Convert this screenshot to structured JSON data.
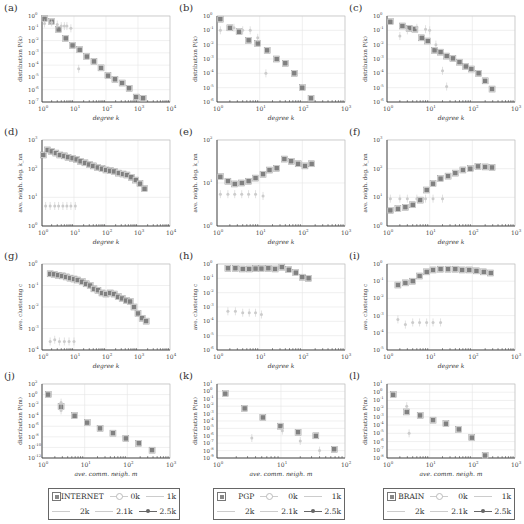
{
  "figure": {
    "panels": [
      {
        "id": "a",
        "label": "(a)"
      },
      {
        "id": "b",
        "label": "(b)"
      },
      {
        "id": "c",
        "label": "(c)"
      },
      {
        "id": "d",
        "label": "(d)"
      },
      {
        "id": "e",
        "label": "(e)"
      },
      {
        "id": "f",
        "label": "(f)"
      },
      {
        "id": "g",
        "label": "(g)"
      },
      {
        "id": "h",
        "label": "(h)"
      },
      {
        "id": "i",
        "label": "(i)"
      },
      {
        "id": "j",
        "label": "(j)"
      },
      {
        "id": "k",
        "label": "(k)"
      },
      {
        "id": "l",
        "label": "(l)"
      }
    ],
    "legends": [
      {
        "dataset": "INTERNET",
        "items": [
          "0k",
          "1k",
          "2k",
          "2.1k",
          "2.5k"
        ]
      },
      {
        "dataset": "PGP",
        "items": [
          "0k",
          "1k",
          "2k",
          "2.1k",
          "2.5k"
        ]
      },
      {
        "dataset": "BRAIN",
        "items": [
          "0k",
          "1k",
          "2k",
          "2.1k",
          "2.5k"
        ]
      }
    ],
    "colors": {
      "dataset_marker": "#808080",
      "model_light": "#cccccc",
      "grid": "#e6e6e6",
      "axis": "#333333"
    }
  },
  "chart_data": [
    {
      "id": "a",
      "type": "scatter",
      "title": "",
      "xlabel": "degree k",
      "ylabel": "distribution P(k)",
      "xscale": "log",
      "yscale": "log",
      "xlim": [
        1,
        10000
      ],
      "ylim": [
        1e-07,
        1
      ],
      "xticks": [
        "10^0",
        "10^1",
        "10^2",
        "10^3",
        "10^4"
      ],
      "yticks": [
        "10^0",
        "10^-1",
        "10^-2",
        "10^-3",
        "10^-4",
        "10^-5",
        "10^-6",
        "10^-7"
      ],
      "grid": true,
      "series": [
        {
          "name": "INTERNET",
          "x": [
            1.2,
            2,
            3.3,
            5.5,
            9,
            15,
            25,
            42,
            70,
            115,
            190,
            320,
            530,
            880,
            1450
          ],
          "y": [
            0.6,
            0.35,
            0.08,
            0.015,
            0.004,
            0.0018,
            0.0005,
            0.0002,
            6e-05,
            1.4e-05,
            7e-06,
            3.5e-06,
            1.3e-06,
            2.5e-07,
            2e-07
          ]
        },
        {
          "name": "model",
          "x": [
            1.2,
            2,
            3,
            4,
            5,
            6,
            8,
            14
          ],
          "y": [
            0.25,
            0.3,
            0.2,
            0.15,
            0.15,
            0.15,
            0.1,
            5e-05
          ]
        }
      ]
    },
    {
      "id": "b",
      "type": "scatter",
      "title": "",
      "xlabel": "degree k",
      "ylabel": "distribution P(k)",
      "xscale": "log",
      "yscale": "log",
      "xlim": [
        1,
        1000
      ],
      "ylim": [
        1e-06,
        1
      ],
      "xticks": [
        "10^0",
        "10^1",
        "10^2",
        "10^3"
      ],
      "yticks": [
        "10^0",
        "10^-1",
        "10^-2",
        "10^-3",
        "10^-4",
        "10^-5",
        "10^-6"
      ],
      "grid": true,
      "series": [
        {
          "name": "PGP",
          "x": [
            1.2,
            2,
            3.3,
            5.5,
            9,
            15,
            25,
            40,
            65,
            100,
            160
          ],
          "y": [
            0.6,
            0.15,
            0.08,
            0.02,
            0.012,
            0.004,
            0.001,
            0.0005,
            0.0001,
            1e-05,
            1.8e-06
          ]
        },
        {
          "name": "model",
          "x": [
            1.2,
            2.5,
            4,
            6,
            9,
            14
          ],
          "y": [
            0.1,
            0.15,
            0.1,
            0.1,
            0.03,
            0.0001
          ]
        }
      ]
    },
    {
      "id": "c",
      "type": "scatter",
      "title": "",
      "xlabel": "degree k",
      "ylabel": "distribution P(k)",
      "xscale": "log",
      "yscale": "log",
      "xlim": [
        1,
        1000
      ],
      "ylim": [
        1e-06,
        1
      ],
      "xticks": [
        "10^0",
        "10^1",
        "10^2",
        "10^3"
      ],
      "yticks": [
        "10^0",
        "10^-1",
        "10^-2",
        "10^-3",
        "10^-4",
        "10^-5",
        "10^-6"
      ],
      "grid": true,
      "series": [
        {
          "name": "BRAIN",
          "x": [
            1.2,
            2.3,
            3.3,
            4.5,
            6.5,
            9,
            13,
            18,
            25,
            35,
            50,
            70,
            95,
            140,
            200,
            290
          ],
          "y": [
            0.4,
            0.2,
            0.14,
            0.12,
            0.03,
            0.018,
            0.004,
            0.003,
            0.0016,
            0.0011,
            0.0006,
            0.0003,
            0.0002,
            0.0001,
            3e-05,
            8e-06
          ]
        },
        {
          "name": "model",
          "x": [
            2,
            3,
            5,
            8,
            10,
            14,
            20,
            25
          ],
          "y": [
            0.04,
            0.1,
            0.15,
            0.12,
            0.1,
            0.01,
            0.00015,
            1.2e-05
          ]
        }
      ]
    },
    {
      "id": "d",
      "type": "scatter",
      "title": "",
      "xlabel": "degree k",
      "ylabel": "ave. neigh. deg. k_nn",
      "xscale": "log",
      "yscale": "log",
      "xlim": [
        1,
        10000
      ],
      "ylim": [
        1,
        1000
      ],
      "xticks": [
        "10^0",
        "10^1",
        "10^2",
        "10^3",
        "10^4"
      ],
      "yticks": [
        "10^3",
        "10^2",
        "10^1",
        "10^0"
      ],
      "grid": true,
      "series": [
        {
          "name": "INTERNET",
          "x": [
            1.1,
            1.5,
            2,
            2.7,
            3.6,
            5,
            6.5,
            9,
            12,
            16,
            22,
            30,
            40,
            55,
            75,
            100,
            135,
            180,
            250,
            340,
            450,
            620,
            850,
            1150,
            1600
          ],
          "y": [
            300,
            450,
            400,
            350,
            300,
            280,
            250,
            230,
            210,
            180,
            160,
            140,
            125,
            110,
            100,
            90,
            85,
            80,
            70,
            65,
            60,
            50,
            40,
            30,
            20
          ]
        },
        {
          "name": "model",
          "x": [
            1.3,
            1.8,
            2.5,
            3.3,
            4.5,
            6,
            8,
            11
          ],
          "y": [
            5,
            5,
            5,
            5,
            5,
            5,
            5,
            5
          ]
        }
      ]
    },
    {
      "id": "e",
      "type": "scatter",
      "title": "",
      "xlabel": "degree k",
      "ylabel": "ave. neigh. deg. k_nn",
      "xscale": "log",
      "yscale": "log",
      "xlim": [
        1,
        1000
      ],
      "ylim": [
        1,
        100
      ],
      "xticks": [
        "10^0",
        "10^1",
        "10^2",
        "10^3"
      ],
      "yticks": [
        "10^2",
        "10^1",
        "10^0"
      ],
      "grid": true,
      "series": [
        {
          "name": "PGP",
          "x": [
            1.2,
            1.8,
            2.6,
            3.8,
            5.5,
            8,
            12,
            17,
            25,
            38,
            55,
            80,
            115,
            165
          ],
          "y": [
            14,
            11,
            9.5,
            10,
            11,
            13,
            16,
            20,
            22,
            36,
            32,
            28,
            25,
            28
          ]
        },
        {
          "name": "model",
          "x": [
            1.2,
            1.8,
            2.6,
            3.8,
            5.5,
            8,
            12
          ],
          "y": [
            5.5,
            5.5,
            5.5,
            5.5,
            5.5,
            5.5,
            5
          ]
        }
      ]
    },
    {
      "id": "f",
      "type": "scatter",
      "title": "",
      "xlabel": "degree k",
      "ylabel": "ave. neigh. deg. k_nn",
      "xscale": "log",
      "yscale": "log",
      "xlim": [
        1,
        1000
      ],
      "ylim": [
        1,
        1000
      ],
      "xticks": [
        "10^0",
        "10^1",
        "10^2",
        "10^3"
      ],
      "yticks": [
        "10^3",
        "10^2",
        "10^1",
        "10^0"
      ],
      "grid": true,
      "series": [
        {
          "name": "BRAIN",
          "x": [
            1.2,
            1.8,
            2.7,
            4,
            6,
            8.5,
            12,
            18,
            27,
            40,
            60,
            90,
            135,
            200,
            290
          ],
          "y": [
            3.5,
            4,
            4.5,
            5.5,
            8,
            18,
            30,
            45,
            55,
            70,
            90,
            100,
            120,
            115,
            110
          ]
        },
        {
          "name": "model",
          "x": [
            1.2,
            2,
            3,
            5,
            8,
            12,
            20
          ],
          "y": [
            9,
            9,
            9,
            9,
            9,
            9,
            9
          ]
        }
      ]
    },
    {
      "id": "g",
      "type": "scatter",
      "title": "",
      "xlabel": "degree k",
      "ylabel": "ave. clustering c",
      "xscale": "log",
      "yscale": "log",
      "xlim": [
        1,
        10000
      ],
      "ylim": [
        0.0001,
        1
      ],
      "xticks": [
        "10^0",
        "10^1",
        "10^2",
        "10^3",
        "10^4"
      ],
      "yticks": [
        "10^0",
        "10^-1",
        "10^-2",
        "10^-3",
        "10^-4"
      ],
      "grid": true,
      "series": [
        {
          "name": "INTERNET",
          "x": [
            1.8,
            2.4,
            3.2,
            4.3,
            5.7,
            7.5,
            10,
            13,
            18,
            24,
            32,
            42,
            56,
            75,
            100,
            135,
            180,
            240,
            320,
            430,
            570,
            750,
            1000,
            1350,
            1800
          ],
          "y": [
            0.35,
            0.33,
            0.3,
            0.28,
            0.25,
            0.22,
            0.2,
            0.18,
            0.15,
            0.12,
            0.1,
            0.07,
            0.06,
            0.045,
            0.04,
            0.045,
            0.04,
            0.03,
            0.025,
            0.02,
            0.018,
            0.01,
            0.005,
            0.003,
            0.0022
          ]
        },
        {
          "name": "model",
          "x": [
            1.8,
            2.5,
            3.5,
            5,
            7,
            10
          ],
          "y": [
            0.00025,
            0.0003,
            0.00025,
            0.00025,
            0.00025,
            0.00025
          ]
        }
      ]
    },
    {
      "id": "h",
      "type": "scatter",
      "title": "",
      "xlabel": "degree k",
      "ylabel": "ave. clustering c",
      "xscale": "log",
      "yscale": "log",
      "xlim": [
        1,
        1000
      ],
      "ylim": [
        1e-06,
        1
      ],
      "xticks": [
        "10^0",
        "10^1",
        "10^2",
        "10^3"
      ],
      "yticks": [
        "10^0",
        "10^-1",
        "10^-2",
        "10^-3",
        "10^-4",
        "10^-5",
        "10^-6"
      ],
      "grid": true,
      "series": [
        {
          "name": "PGP",
          "x": [
            1.8,
            2.7,
            4,
            5.7,
            8,
            11,
            16,
            23,
            33,
            48,
            70,
            100,
            140
          ],
          "y": [
            0.5,
            0.5,
            0.45,
            0.45,
            0.48,
            0.48,
            0.5,
            0.45,
            0.6,
            0.4,
            0.25,
            0.12,
            0.1
          ]
        },
        {
          "name": "model",
          "x": [
            1.8,
            2.7,
            4,
            5.7,
            8,
            11
          ],
          "y": [
            0.0005,
            0.0005,
            0.0004,
            0.0004,
            0.0004,
            0.0003
          ]
        }
      ]
    },
    {
      "id": "i",
      "type": "scatter",
      "title": "",
      "xlabel": "degree k",
      "ylabel": "ave. clustering c",
      "xscale": "log",
      "yscale": "log",
      "xlim": [
        1,
        1000
      ],
      "ylim": [
        1e-05,
        1
      ],
      "xticks": [
        "10^0",
        "10^1",
        "10^2",
        "10^3"
      ],
      "yticks": [
        "10^0",
        "10^-1",
        "10^-2",
        "10^-3",
        "10^-4",
        "10^-5"
      ],
      "grid": true,
      "series": [
        {
          "name": "BRAIN",
          "x": [
            1.8,
            2.7,
            4,
            5.8,
            8.5,
            12,
            18,
            27,
            40,
            58,
            85,
            125,
            185,
            270
          ],
          "y": [
            0.06,
            0.08,
            0.1,
            0.2,
            0.35,
            0.45,
            0.5,
            0.5,
            0.5,
            0.45,
            0.45,
            0.4,
            0.35,
            0.3
          ]
        },
        {
          "name": "model",
          "x": [
            1.8,
            2.7,
            4,
            5.8,
            8.5,
            12,
            18
          ],
          "y": [
            0.0006,
            0.0003,
            0.0004,
            0.0004,
            0.0004,
            0.0004,
            0.0004
          ]
        }
      ]
    },
    {
      "id": "j",
      "type": "scatter",
      "title": "",
      "xlabel": "ave. comm. neigh. m",
      "ylabel": "distribution P(m)",
      "xscale": "log",
      "yscale": "log",
      "xlim": [
        1,
        1000
      ],
      "ylim": [
        1e-12,
        100
      ],
      "xticks": [
        "10^0",
        "10^1",
        "10^2",
        "10^3"
      ],
      "yticks": [
        "10^2",
        "10^0",
        "10^-2",
        "10^-4",
        "10^-6",
        "10^-8",
        "10^-10",
        "10^-12"
      ],
      "grid": true,
      "series": [
        {
          "name": "INTERNET",
          "x": [
            1.4,
            2.8,
            5.8,
            11.5,
            23,
            46,
            92,
            185,
            380
          ],
          "y": [
            1,
            0.005,
            0.0001,
            5e-06,
            4e-07,
            5e-08,
            5e-09,
            6e-10,
            3e-11
          ]
        },
        {
          "name": "model",
          "x": [
            2.8,
            2.8
          ],
          "y": [
            0.03,
            0.001
          ]
        }
      ]
    },
    {
      "id": "k",
      "type": "scatter",
      "title": "",
      "xlabel": "ave. comm. neigh. m",
      "ylabel": "distribution P(m)",
      "xscale": "log",
      "yscale": "log",
      "xlim": [
        1,
        100
      ],
      "ylim": [
        1e-09,
        10
      ],
      "xticks": [
        "10^0",
        "10^1",
        "10^2"
      ],
      "yticks": [
        "10^1",
        "10^0",
        "10^-1",
        "10^-2",
        "10^-3",
        "10^-4",
        "10^-5",
        "10^-6",
        "10^-7",
        "10^-8",
        "10^-9"
      ],
      "grid": true,
      "series": [
        {
          "name": "PGP",
          "x": [
            1.35,
            2.7,
            5.2,
            9.8,
            18.5,
            35,
            68
          ],
          "y": [
            0.5,
            0.005,
            0.0003,
            2e-05,
            3e-06,
            1e-06,
            1.5e-08
          ]
        },
        {
          "name": "model",
          "x": [
            3.5,
            10.5,
            20,
            40
          ],
          "y": [
            5e-07,
            5e-06,
            2e-07,
            1e-08
          ]
        }
      ]
    },
    {
      "id": "l",
      "type": "scatter",
      "title": "",
      "xlabel": "ave. comm. neigh. m",
      "ylabel": "distribution P(m)",
      "xscale": "log",
      "yscale": "log",
      "xlim": [
        1,
        1000
      ],
      "ylim": [
        1e-08,
        10
      ],
      "xticks": [
        "10^0",
        "10^1",
        "10^2",
        "10^3"
      ],
      "yticks": [
        "10^1",
        "10^0",
        "10^-1",
        "10^-2",
        "10^-3",
        "10^-4",
        "10^-5",
        "10^-6",
        "10^-7",
        "10^-8"
      ],
      "grid": true,
      "series": [
        {
          "name": "BRAIN",
          "x": [
            1.4,
            2.9,
            6,
            12,
            24,
            48,
            97,
            200
          ],
          "y": [
            0.5,
            0.004,
            0.0015,
            0.0004,
            0.00015,
            3e-05,
            3e-06,
            2e-08
          ]
        },
        {
          "name": "model",
          "x": [
            2.9,
            3.3
          ],
          "y": [
            0.02,
            1e-05
          ]
        }
      ]
    }
  ]
}
